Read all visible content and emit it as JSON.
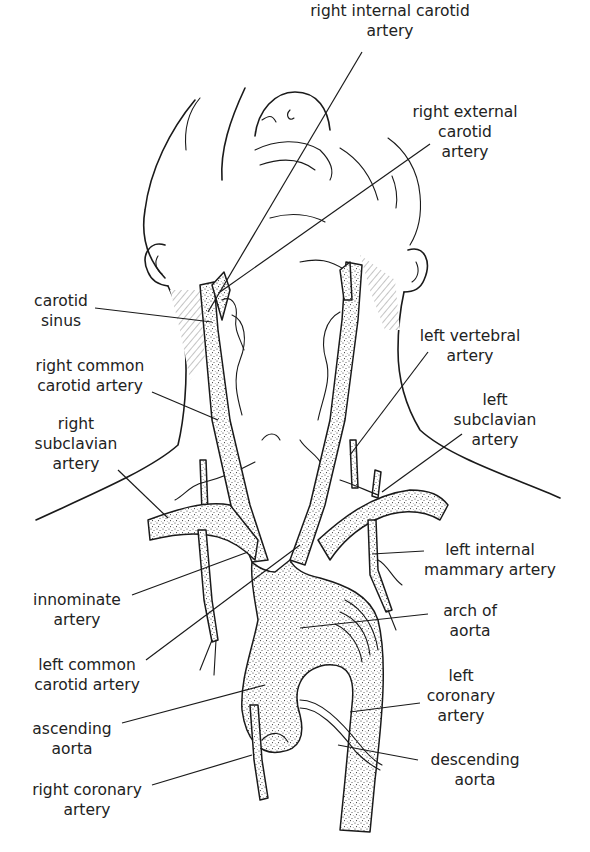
{
  "figure": {
    "colors": {
      "ink": "#1a1a1a",
      "text": "#222222",
      "background": "#ffffff"
    }
  },
  "labels": {
    "right_internal_carotid": [
      "right internal carotid",
      "artery"
    ],
    "right_external_carotid": [
      "right external",
      "carotid",
      "artery"
    ],
    "carotid_sinus": [
      "carotid",
      "sinus"
    ],
    "right_common_carotid": [
      "right common",
      "carotid artery"
    ],
    "right_subclavian": [
      "right",
      "subclavian",
      "artery"
    ],
    "left_vertebral": [
      "left vertebral",
      "artery"
    ],
    "left_subclavian": [
      "left",
      "subclavian",
      "artery"
    ],
    "left_internal_mammary": [
      "left internal",
      "mammary artery"
    ],
    "innominate": [
      "innominate",
      "artery"
    ],
    "left_common_carotid": [
      "left common",
      "carotid artery"
    ],
    "arch_of_aorta": [
      "arch of",
      "aorta"
    ],
    "ascending_aorta": [
      "ascending",
      "aorta"
    ],
    "left_coronary": [
      "left",
      "coronary",
      "artery"
    ],
    "descending_aorta": [
      "descending",
      "aorta"
    ],
    "right_coronary": [
      "right coronary",
      "artery"
    ]
  }
}
